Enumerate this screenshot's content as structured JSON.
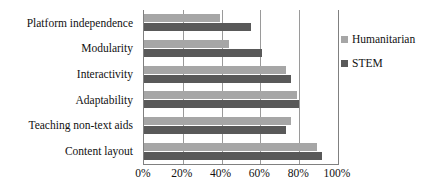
{
  "chart_data": {
    "type": "bar",
    "orientation": "horizontal",
    "title": "",
    "xlabel": "",
    "ylabel": "",
    "xlim": [
      0,
      100
    ],
    "grid": true,
    "legend_position": "right",
    "categories": [
      "Platform independence",
      "Modularity",
      "Interactivity",
      "Adaptability",
      "Teaching non-text aids",
      "Content layout"
    ],
    "tick_labels": [
      "0%",
      "20%",
      "40%",
      "60%",
      "80%",
      "100%"
    ],
    "tick_values": [
      0,
      20,
      40,
      60,
      80,
      100
    ],
    "series": [
      {
        "name": "Humanitarian",
        "color": "#a6a6a6",
        "values": [
          39,
          44,
          73,
          79,
          76,
          89
        ]
      },
      {
        "name": "STEM",
        "color": "#595959",
        "values": [
          55,
          61,
          76,
          80,
          73,
          92
        ]
      }
    ]
  }
}
